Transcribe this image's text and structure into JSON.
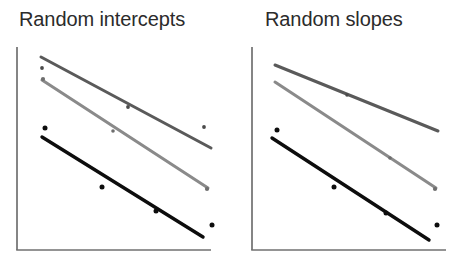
{
  "figure": {
    "width": 454,
    "height": 262,
    "background": "#ffffff"
  },
  "panels": [
    {
      "id": "random-intercepts",
      "title": "Random intercepts",
      "title_pos": {
        "x": 19,
        "y": 8
      },
      "axes": {
        "y_axis": {
          "x": 17,
          "y_top": 47,
          "y_bottom": 250,
          "color": "#707070",
          "width": 1.6
        },
        "x_axis": {
          "y": 250,
          "x_left": 17,
          "x_right": 211,
          "color": "#707070",
          "width": 1.6
        },
        "ticks": false,
        "tick_labels": false
      }
    },
    {
      "id": "random-slopes",
      "title": "Random slopes",
      "title_pos": {
        "x": 265,
        "y": 8
      },
      "axes": {
        "y_axis": {
          "x": 252,
          "y_top": 47,
          "y_bottom": 250,
          "color": "#707070",
          "width": 1.6
        },
        "x_axis": {
          "y": 250,
          "x_left": 252,
          "x_right": 446,
          "color": "#707070",
          "width": 1.6
        },
        "ticks": false,
        "tick_labels": false
      }
    }
  ],
  "chart_data": {
    "type": "line",
    "xlabel": "",
    "ylabel": "",
    "grid": false,
    "legend": "none",
    "axis_ticks_labeled": false,
    "panels": [
      {
        "name": "Random intercepts",
        "title": "Random intercepts",
        "note": "Three fitted regression lines with identical (parallel) slopes but different intercepts; scattered observed points around each line.",
        "xlim": [
          0,
          1
        ],
        "ylim": [
          0,
          1
        ],
        "series": [
          {
            "name": "group-1-dark-gray",
            "color": "#5a5a5a",
            "line_width": 3.0,
            "line": {
              "x1": 41,
              "y1": 57,
              "x2": 211,
              "y2": 148
            },
            "slope_sign": "negative",
            "points": [
              {
                "x": 42,
                "y": 68
              },
              {
                "x": 128,
                "y": 107
              },
              {
                "x": 204,
                "y": 127
              }
            ]
          },
          {
            "name": "group-2-light-gray",
            "color": "#8a8a8a",
            "line_width": 3.0,
            "line": {
              "x1": 42,
              "y1": 80,
              "x2": 208,
              "y2": 188
            },
            "slope_sign": "negative",
            "points": [
              {
                "x": 43,
                "y": 79
              },
              {
                "x": 113,
                "y": 131
              },
              {
                "x": 207,
                "y": 189
              }
            ]
          },
          {
            "name": "group-3-black",
            "color": "#0d0d0d",
            "line_width": 3.4,
            "line": {
              "x1": 42,
              "y1": 137,
              "x2": 203,
              "y2": 237
            },
            "slope_sign": "negative",
            "points": [
              {
                "x": 45,
                "y": 128
              },
              {
                "x": 102,
                "y": 187
              },
              {
                "x": 156,
                "y": 211
              },
              {
                "x": 212,
                "y": 225
              }
            ]
          }
        ]
      },
      {
        "name": "Random slopes",
        "title": "Random slopes",
        "note": "Three fitted regression lines with different slopes that fan apart to the right; scattered observed points around the black line.",
        "xlim": [
          0,
          1
        ],
        "ylim": [
          0,
          1
        ],
        "series": [
          {
            "name": "group-1-dark-gray",
            "color": "#5a5a5a",
            "line_width": 3.0,
            "line": {
              "x1": 275,
              "y1": 65,
              "x2": 438,
              "y2": 131
            },
            "slope_sign": "negative",
            "points": [
              {
                "x": 347,
                "y": 95
              }
            ]
          },
          {
            "name": "group-2-light-gray",
            "color": "#8a8a8a",
            "line_width": 3.0,
            "line": {
              "x1": 275,
              "y1": 82,
              "x2": 436,
              "y2": 188
            },
            "slope_sign": "negative",
            "points": [
              {
                "x": 390,
                "y": 158
              },
              {
                "x": 435,
                "y": 189
              }
            ]
          },
          {
            "name": "group-3-black",
            "color": "#0d0d0d",
            "line_width": 3.4,
            "line": {
              "x1": 272,
              "y1": 138,
              "x2": 429,
              "y2": 240
            },
            "slope_sign": "negative",
            "points": [
              {
                "x": 277,
                "y": 130
              },
              {
                "x": 334,
                "y": 187
              },
              {
                "x": 386,
                "y": 213
              },
              {
                "x": 437,
                "y": 225
              }
            ]
          }
        ]
      }
    ]
  }
}
